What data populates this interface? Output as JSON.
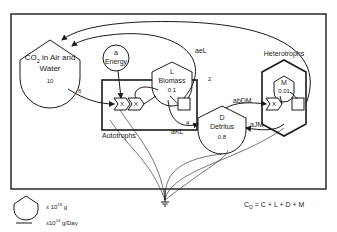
{
  "diagram": {
    "type": "energy-circuit-model",
    "compartments": {
      "co2": {
        "symbol": "CO",
        "sub": "2",
        "rest": " in Air and",
        "line2": "Water",
        "value": "10"
      },
      "energy": {
        "symbol": "a",
        "label": "Energy"
      },
      "biomass": {
        "symbol": "L",
        "label": "Biomass",
        "value": "0.1"
      },
      "detritus": {
        "symbol": "D",
        "label": "Detritus",
        "value": "0.8"
      },
      "microbes": {
        "symbol": "M",
        "value": "0.01"
      }
    },
    "groups": {
      "autotrophs": "Autotrophs",
      "heterotrophs": "Heterotrophs"
    },
    "flows": {
      "co2_uptake": "6",
      "aeL": "aeL",
      "resp_auto": "2",
      "aKL": "aKL",
      "litter": "4",
      "abDM": "abDM",
      "aJM": "aJM"
    },
    "multiplier": "X",
    "legend": {
      "storage_units": "x 10",
      "storage_exp": "18",
      "storage_tail": " g",
      "flow_units": "x10",
      "flow_exp": "14",
      "flow_tail": " g/Day"
    },
    "equation": {
      "lhs": "C",
      "lhs_sub": "O",
      "rhs": " = C + L + D + M"
    }
  }
}
